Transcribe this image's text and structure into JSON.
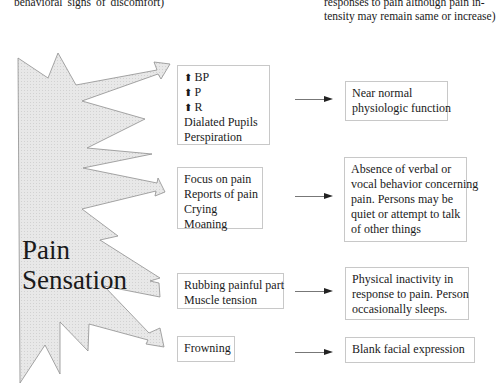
{
  "header": {
    "left_text_fragment": "behavioral signs of discomfort)",
    "right_text_lines": [
      "responses to pain although pain in-",
      "tensity may remain same or increase)"
    ]
  },
  "starburst": {
    "label_lines": [
      "Pain",
      "Sensation"
    ],
    "fill_color": "#e6e6e6",
    "stroke_color": "#8a8a8a"
  },
  "rows": [
    {
      "stimulus_lines": [
        {
          "icon": "up-arrow-icon",
          "text": "BP"
        },
        {
          "icon": "up-arrow-icon",
          "text": "P"
        },
        {
          "icon": "up-arrow-icon",
          "text": "R"
        },
        {
          "icon": "",
          "text": "Dialated Pupils"
        },
        {
          "icon": "",
          "text": "Perspiration"
        }
      ],
      "response_lines": [
        "Near normal",
        "physiologic function"
      ]
    },
    {
      "stimulus_lines": [
        {
          "icon": "",
          "text": "Focus on pain"
        },
        {
          "icon": "",
          "text": "Reports of pain"
        },
        {
          "icon": "",
          "text": "Crying"
        },
        {
          "icon": "",
          "text": "Moaning"
        }
      ],
      "response_lines": [
        "Absence of verbal or",
        "vocal behavior concerning",
        "pain. Persons may be",
        "quiet or attempt to talk",
        "of other things"
      ]
    },
    {
      "stimulus_lines": [
        {
          "icon": "",
          "text": "Rubbing painful part"
        },
        {
          "icon": "",
          "text": "Muscle tension"
        }
      ],
      "response_lines": [
        "Physical inactivity in",
        "response to pain. Person",
        "occasionally sleeps."
      ]
    },
    {
      "stimulus_lines": [
        {
          "icon": "",
          "text": "Frowning"
        }
      ],
      "response_lines": [
        "Blank facial expression"
      ]
    }
  ],
  "up_arrow_glyph": "⬆"
}
